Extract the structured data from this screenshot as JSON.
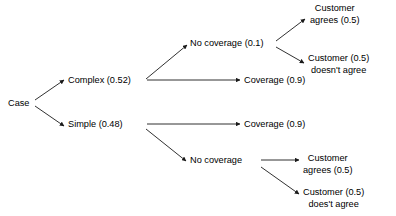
{
  "diagram": {
    "type": "decision-tree",
    "title": "",
    "nodes": {
      "root": {
        "label": "Case",
        "x": 8,
        "y": 98
      },
      "complex": {
        "label": "Complex (0.52)",
        "probability": "0.52",
        "x": 68,
        "y": 75
      },
      "simple": {
        "label": "Simple (0.48)",
        "probability": "0.48",
        "x": 68,
        "y": 119
      },
      "complex_no_coverage": {
        "label": "No coverage (0.1)",
        "probability": "0.1",
        "x": 190,
        "y": 38
      },
      "complex_coverage": {
        "label": "Coverage (0.9)",
        "probability": "0.9",
        "x": 244,
        "y": 75
      },
      "simple_coverage": {
        "label": "Coverage (0.9)",
        "probability": "0.9",
        "x": 244,
        "y": 119
      },
      "simple_no_coverage": {
        "label": "No coverage",
        "probability": "",
        "x": 190,
        "y": 155
      },
      "leaf_agrees_top": {
        "line1": "Customer",
        "line2": "agrees (0.5)",
        "probability": "0.5",
        "x": 310,
        "y": 3
      },
      "leaf_disagrees_top": {
        "line1": "Customer (0.5)",
        "line2": "doesn't agree",
        "probability": "0.5",
        "x": 308,
        "y": 53
      },
      "leaf_agrees_bottom": {
        "line1": "Customer",
        "line2": "agrees (0.5)",
        "probability": "0.5",
        "x": 303,
        "y": 153
      },
      "leaf_disagrees_bottom": {
        "line1": "Customer (0.5)",
        "line2": "does't agree",
        "probability": "0.5",
        "x": 303,
        "y": 187
      }
    },
    "edges": [
      {
        "from": "root",
        "to": "complex"
      },
      {
        "from": "root",
        "to": "simple"
      },
      {
        "from": "complex",
        "to": "complex_no_coverage"
      },
      {
        "from": "complex",
        "to": "complex_coverage"
      },
      {
        "from": "complex_no_coverage",
        "to": "leaf_agrees_top"
      },
      {
        "from": "complex_no_coverage",
        "to": "leaf_disagrees_top"
      },
      {
        "from": "simple",
        "to": "simple_coverage"
      },
      {
        "from": "simple",
        "to": "simple_no_coverage"
      },
      {
        "from": "simple_no_coverage",
        "to": "leaf_agrees_bottom"
      },
      {
        "from": "simple_no_coverage",
        "to": "leaf_disagrees_bottom"
      }
    ],
    "colors": {
      "text": "#000000",
      "edge": "#1a1a1a",
      "background": "#ffffff"
    }
  }
}
